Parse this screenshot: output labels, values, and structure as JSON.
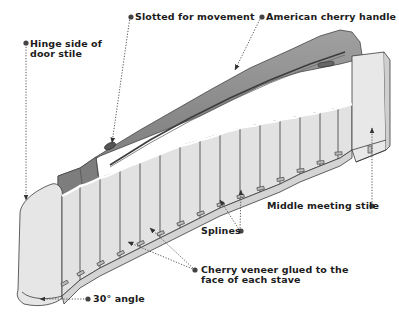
{
  "diagram": {
    "type": "exploded-illustration",
    "colors": {
      "stave_fill": "#e4e4e4",
      "stave_line": "#3a3a3a",
      "handle_fill": "#8f8f8f",
      "handle_dark": "#6b6b6b",
      "handle_light": "#a8a8a8",
      "label_text": "#1c1c1c",
      "leader": "#555555",
      "background": "#ffffff"
    },
    "callouts": [
      {
        "id": "slotted",
        "lines": [
          "Slotted for movement"
        ]
      },
      {
        "id": "handle",
        "lines": [
          "American cherry handle"
        ]
      },
      {
        "id": "hinge",
        "lines": [
          "Hinge side of",
          "door stile"
        ]
      },
      {
        "id": "meeting",
        "lines": [
          "Middle meeting stile"
        ]
      },
      {
        "id": "splines",
        "lines": [
          "Splines"
        ]
      },
      {
        "id": "veneer",
        "lines": [
          "Cherry veneer glued to the",
          "face of each stave"
        ]
      },
      {
        "id": "angle",
        "lines": [
          "30° angle"
        ]
      }
    ]
  }
}
